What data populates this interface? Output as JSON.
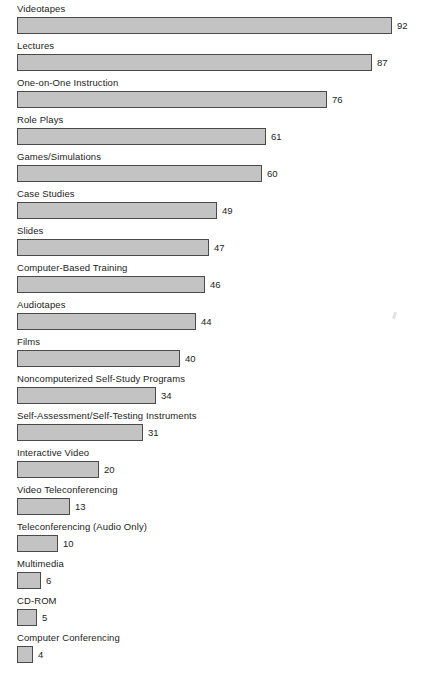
{
  "chart_data": {
    "type": "bar",
    "orientation": "horizontal",
    "title": "",
    "subtitle": "",
    "xlabel": "",
    "ylabel": "",
    "xlim": [
      0,
      92
    ],
    "grid": false,
    "legend": null,
    "value_label_position": "outside-right",
    "categories": [
      "Videotapes",
      "Lectures",
      "One-on-One Instruction",
      "Role Plays",
      "Games/Simulations",
      "Case Studies",
      "Slides",
      "Computer-Based Training",
      "Audiotapes",
      "Films",
      "Noncomputerized Self-Study Programs",
      "Self-Assessment/Self-Testing Instruments",
      "Interactive Video",
      "Video Teleconferencing",
      "Teleconferencing (Audio Only)",
      "Multimedia",
      "CD-ROM",
      "Computer Conferencing"
    ],
    "values": [
      92,
      87,
      76,
      61,
      60,
      49,
      47,
      46,
      44,
      40,
      34,
      31,
      20,
      13,
      10,
      6,
      5,
      4
    ],
    "colors": {
      "bar_fill": "#c3c3c3",
      "bar_border": "#4a4a4a",
      "text": "#1c1c1c",
      "background": "#ffffff"
    }
  }
}
